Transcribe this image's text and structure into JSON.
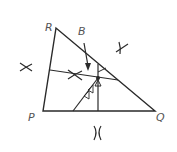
{
  "diagram": {
    "type": "geometry-construction",
    "vertices": {
      "R": {
        "label": "R",
        "x": 56,
        "y": 28
      },
      "P": {
        "label": "P",
        "x": 43,
        "y": 111
      },
      "Q": {
        "label": "Q",
        "x": 155,
        "y": 111
      }
    },
    "point_labels": {
      "B": {
        "label": "B"
      }
    },
    "colors": {
      "stroke": "#2a2a2a",
      "label": "#555555",
      "background": "#ffffff"
    }
  }
}
